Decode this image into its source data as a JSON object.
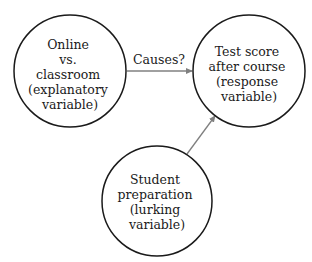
{
  "diagram": {
    "nodes": [
      {
        "id": "explanatory",
        "lines": [
          "Online",
          "vs.",
          "classroom",
          "(explanatory",
          "variable)"
        ],
        "cx": 70,
        "cy": 71,
        "r": 56
      },
      {
        "id": "response",
        "lines": [
          "Test score",
          "after course",
          "(response",
          "variable)"
        ],
        "cx": 249,
        "cy": 71,
        "r": 56
      },
      {
        "id": "lurking",
        "lines": [
          "Student",
          "preparation",
          "(lurking",
          "variable)"
        ],
        "cx": 157,
        "cy": 201,
        "r": 55
      }
    ],
    "edges": [
      {
        "from": "explanatory",
        "to": "response",
        "label": "Causes?"
      },
      {
        "from": "lurking",
        "to": "response",
        "label": ""
      }
    ],
    "colors": {
      "circle_stroke": "#1a1a1a",
      "arrow": "#808080",
      "text": "#1a1a1a",
      "background": "#ffffff"
    }
  }
}
